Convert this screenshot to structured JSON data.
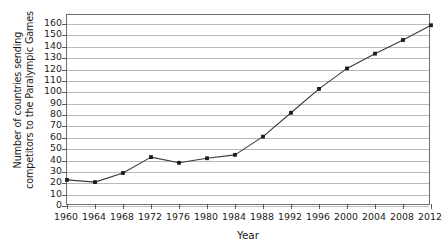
{
  "chart_data": {
    "type": "line",
    "title": "",
    "xlabel": "Year",
    "ylabel_lines": [
      "Number of countries sending",
      "competitors to the Paralympic Games"
    ],
    "ylabel": "Number of countries sending competitors to the Paralympic Games",
    "x": [
      1960,
      1964,
      1968,
      1972,
      1976,
      1980,
      1984,
      1988,
      1992,
      1996,
      2000,
      2004,
      2008,
      2012
    ],
    "values": [
      23,
      21,
      29,
      43,
      38,
      42,
      45,
      61,
      82,
      103,
      121,
      134,
      146,
      159
    ],
    "categories": [
      "1960",
      "1964",
      "1968",
      "1972",
      "1976",
      "1980",
      "1984",
      "1988",
      "1992",
      "1996",
      "2000",
      "2004",
      "2008",
      "2012"
    ],
    "xtick_labels": [
      "1960",
      "1964",
      "1968",
      "1972",
      "1976",
      "1980",
      "1984",
      "1988",
      "1992",
      "1996",
      "2000",
      "2004",
      "2008",
      "2012"
    ],
    "ytick_labels": [
      "0",
      "10",
      "20",
      "30",
      "40",
      "50",
      "60",
      "70",
      "80",
      "90",
      "100",
      "110",
      "120",
      "130",
      "140",
      "150",
      "160"
    ],
    "ytick_values": [
      0,
      10,
      20,
      30,
      40,
      50,
      60,
      70,
      80,
      90,
      100,
      110,
      120,
      130,
      140,
      150,
      160
    ],
    "xlim": [
      1960,
      2012
    ],
    "ylim": [
      0,
      168
    ],
    "grid": "horizontal",
    "legend": "none",
    "series_color": "#3a3a3a",
    "marker_color": "#1b1b1b",
    "gridline_color": "#b9b9b9",
    "frame_color": "#6e6e6e"
  }
}
